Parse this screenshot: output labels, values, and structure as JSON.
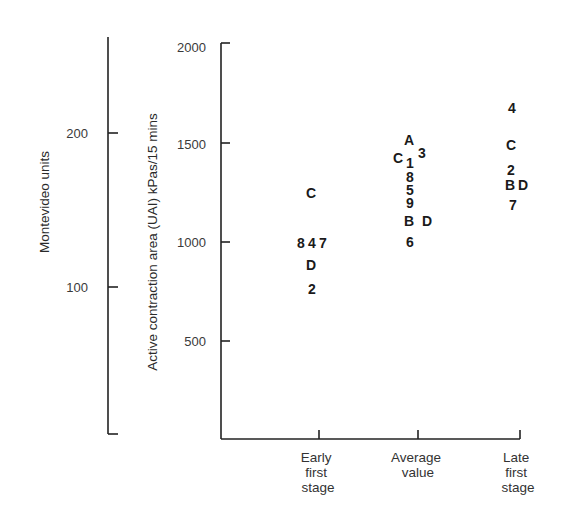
{
  "chart_data": {
    "type": "scatter",
    "title": "",
    "xlabel": "",
    "ylabel": "Active contraction area (UAI) kPas/15 mins",
    "secondary_ylabel": "Montevideo units",
    "categories": [
      "Early first stage",
      "Average value",
      "Late first stage"
    ],
    "category_label_lines": [
      [
        "Early",
        "first",
        "stage"
      ],
      [
        "Average",
        "value"
      ],
      [
        "Late",
        "first",
        "stage"
      ]
    ],
    "ylim": [
      0,
      2000
    ],
    "yticks": [
      500,
      1000,
      1500,
      2000
    ],
    "secondary_yticks": [
      100,
      200
    ],
    "grid": false,
    "legend": "none — points are labeled with subject codes (letters A–D, digits 1–9)",
    "series": [
      {
        "name": "Early first stage",
        "points": [
          {
            "label": "C",
            "value": 1250
          },
          {
            "label": "8",
            "value": 1000
          },
          {
            "label": "4",
            "value": 1000
          },
          {
            "label": "7",
            "value": 1000
          },
          {
            "label": "D",
            "value": 885
          },
          {
            "label": "2",
            "value": 765
          }
        ]
      },
      {
        "name": "Average value",
        "points": [
          {
            "label": "A",
            "value": 1515
          },
          {
            "label": "3",
            "value": 1450
          },
          {
            "label": "C",
            "value": 1425
          },
          {
            "label": "1",
            "value": 1395
          },
          {
            "label": "8",
            "value": 1325
          },
          {
            "label": "5",
            "value": 1260
          },
          {
            "label": "9",
            "value": 1195
          },
          {
            "label": "B",
            "value": 1105
          },
          {
            "label": "D",
            "value": 1105
          },
          {
            "label": "6",
            "value": 1000
          }
        ]
      },
      {
        "name": "Late first stage",
        "points": [
          {
            "label": "4",
            "value": 1680
          },
          {
            "label": "C",
            "value": 1495
          },
          {
            "label": "2",
            "value": 1370
          },
          {
            "label": "B",
            "value": 1295
          },
          {
            "label": "D",
            "value": 1295
          },
          {
            "label": "7",
            "value": 1195
          }
        ]
      }
    ]
  },
  "layout_points": [
    [
      {
        "label": "C",
        "x": 311,
        "y": 193
      },
      {
        "label": "8",
        "x": 301,
        "y": 243
      },
      {
        "label": "4",
        "x": 312,
        "y": 243
      },
      {
        "label": "7",
        "x": 323,
        "y": 243
      },
      {
        "label": "D",
        "x": 311,
        "y": 265
      },
      {
        "label": "2",
        "x": 312,
        "y": 289
      }
    ],
    [
      {
        "label": "A",
        "x": 409,
        "y": 140
      },
      {
        "label": "3",
        "x": 422,
        "y": 153
      },
      {
        "label": "C",
        "x": 398,
        "y": 158
      },
      {
        "label": "1",
        "x": 410,
        "y": 163
      },
      {
        "label": "8",
        "x": 410,
        "y": 177
      },
      {
        "label": "5",
        "x": 410,
        "y": 190
      },
      {
        "label": "9",
        "x": 410,
        "y": 203
      },
      {
        "label": "B",
        "x": 409,
        "y": 221
      },
      {
        "label": "D",
        "x": 427,
        "y": 221
      },
      {
        "label": "6",
        "x": 410,
        "y": 242
      }
    ],
    [
      {
        "label": "4",
        "x": 512,
        "y": 108
      },
      {
        "label": "C",
        "x": 511,
        "y": 145
      },
      {
        "label": "2",
        "x": 511,
        "y": 170
      },
      {
        "label": "B",
        "x": 510,
        "y": 185
      },
      {
        "label": "D",
        "x": 523,
        "y": 185
      },
      {
        "label": "7",
        "x": 513,
        "y": 205
      }
    ]
  ]
}
